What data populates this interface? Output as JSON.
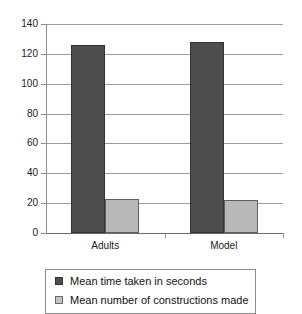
{
  "chart_data": {
    "type": "bar",
    "title": "",
    "subtitle": "",
    "xlabel": "",
    "ylabel": "",
    "categories": [
      "Adults",
      "Model"
    ],
    "series": [
      {
        "name": "Mean time taken in seconds",
        "values": [
          126,
          128
        ],
        "color": "#4d4d4d"
      },
      {
        "name": "Mean number of constructions made",
        "values": [
          23,
          22
        ],
        "color": "#b8b8b8"
      }
    ],
    "ylim": [
      0,
      140
    ],
    "ytick_values": [
      0,
      20,
      40,
      60,
      80,
      100,
      120,
      140
    ],
    "ytick_labels": [
      "0",
      "20",
      "40",
      "60",
      "80",
      "100",
      "120",
      "140"
    ],
    "grid": true,
    "grid_axis": "y",
    "legend_position": "bottom",
    "legend_entries": [
      "Mean time taken in seconds",
      "Mean number of constructions made"
    ],
    "annotations": []
  },
  "colors": {
    "series_0": "#4d4d4d",
    "series_1": "#b8b8b8",
    "gridline": "#9a9a9a",
    "axis": "#8c8c8c",
    "text": "#111111",
    "background": "#ffffff"
  }
}
